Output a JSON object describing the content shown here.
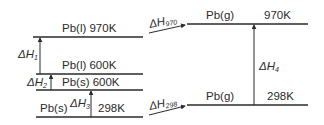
{
  "diagram": {
    "type": "enthalpy-level-diagram",
    "colors": {
      "line": "#2a2a2a",
      "background": "#ffffff"
    },
    "levels": [
      {
        "id": "pb-l-970",
        "state": "Pb(l)",
        "temp": "970K",
        "label": "Pb(l) 970K"
      },
      {
        "id": "pb-l-600",
        "state": "Pb(l)",
        "temp": "600K",
        "label": "Pb(l) 600K"
      },
      {
        "id": "pb-s-600",
        "state": "Pb(s)",
        "temp": "600K",
        "label": "Pb(s) 600K"
      },
      {
        "id": "pb-s-298",
        "state": "Pb(s)",
        "temp": "298K",
        "label_state": "Pb(s)",
        "label_temp": "298K"
      },
      {
        "id": "pb-g-970",
        "state": "Pb(g)",
        "temp": "970K",
        "label_state": "Pb(g)",
        "label_temp": "970K"
      },
      {
        "id": "pb-g-298",
        "state": "Pb(g)",
        "temp": "298K",
        "label_state": "Pb(g)",
        "label_temp": "298K"
      }
    ],
    "arrows": [
      {
        "id": "dh1",
        "symbol": "ΔH",
        "sub": "1",
        "from": "pb-l-600",
        "to": "pb-l-970"
      },
      {
        "id": "dh2",
        "symbol": "ΔH",
        "sub": "2",
        "from": "pb-s-600",
        "to": "pb-l-600"
      },
      {
        "id": "dh3",
        "symbol": "ΔH",
        "sub": "3",
        "from": "pb-s-298",
        "to": "pb-s-600"
      },
      {
        "id": "dh4",
        "symbol": "ΔH",
        "sub": "4",
        "from": "pb-g-298",
        "to": "pb-g-970"
      },
      {
        "id": "dh970",
        "symbol": "ΔH",
        "sub": "970",
        "from": "pb-l-970",
        "to": "pb-g-970"
      },
      {
        "id": "dh298",
        "symbol": "ΔH",
        "sub": "298",
        "from": "pb-s-298",
        "to": "pb-g-298"
      }
    ]
  }
}
